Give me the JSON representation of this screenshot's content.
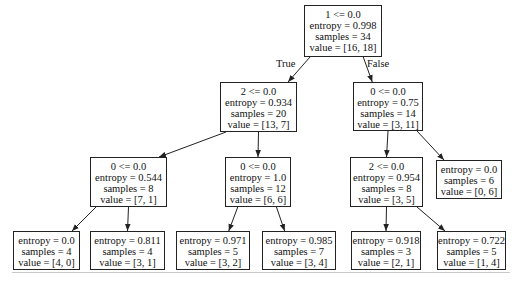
{
  "diagram": {
    "type": "decision-tree",
    "edge_labels": {
      "true": "True",
      "false": "False"
    },
    "nodes": [
      {
        "id": "n0",
        "lines": [
          "1 <= 0.0",
          "entropy = 0.998",
          "samples = 34",
          "value = [16, 18]"
        ],
        "box": [
          304,
          5,
          78,
          52
        ]
      },
      {
        "id": "n1",
        "lines": [
          "2 <= 0.0",
          "entropy = 0.934",
          "samples = 20",
          "value = [13, 7]"
        ],
        "box": [
          220,
          82,
          77,
          50
        ]
      },
      {
        "id": "n2",
        "lines": [
          "0 <= 0.0",
          "entropy = 0.75",
          "samples = 14",
          "value = [3, 11]"
        ],
        "box": [
          353,
          82,
          70,
          49
        ]
      },
      {
        "id": "n3",
        "lines": [
          "0 <= 0.0",
          "entropy = 0.544",
          "samples = 8",
          "value = [7, 1]"
        ],
        "box": [
          90,
          157,
          77,
          50
        ]
      },
      {
        "id": "n4",
        "lines": [
          "0 <= 0.0",
          "entropy = 1.0",
          "samples = 12",
          "value = [6, 6]"
        ],
        "box": [
          225,
          157,
          66,
          50
        ]
      },
      {
        "id": "n5",
        "lines": [
          "2 <= 0.0",
          "entropy = 0.954",
          "samples = 8",
          "value = [3, 5]"
        ],
        "box": [
          350,
          157,
          73,
          50
        ]
      },
      {
        "id": "n6",
        "lines": [
          "entropy = 0.0",
          "samples = 6",
          "value = [0, 6]"
        ],
        "box": [
          436,
          160,
          66,
          39
        ]
      },
      {
        "id": "n7",
        "lines": [
          "entropy = 0.0",
          "samples = 4",
          "value = [4, 0]"
        ],
        "box": [
          13,
          231,
          67,
          39
        ]
      },
      {
        "id": "n8",
        "lines": [
          "entropy = 0.811",
          "samples = 4",
          "value = [3, 1]"
        ],
        "box": [
          90,
          231,
          75,
          39
        ]
      },
      {
        "id": "n9",
        "lines": [
          "entropy = 0.971",
          "samples = 5",
          "value = [3, 2]"
        ],
        "box": [
          176,
          231,
          74,
          39
        ]
      },
      {
        "id": "n10",
        "lines": [
          "entropy = 0.985",
          "samples = 7",
          "value = [3, 4]"
        ],
        "box": [
          262,
          231,
          74,
          39
        ]
      },
      {
        "id": "n11",
        "lines": [
          "entropy = 0.918",
          "samples = 3",
          "value = [2, 1]"
        ],
        "box": [
          351,
          231,
          70,
          39
        ]
      },
      {
        "id": "n12",
        "lines": [
          "entropy = 0.722",
          "samples = 5",
          "value = [1, 4]"
        ],
        "box": [
          437,
          231,
          69,
          39
        ]
      }
    ],
    "edges": [
      {
        "from": "n0",
        "to": "n1",
        "label": "True"
      },
      {
        "from": "n0",
        "to": "n2",
        "label": "False"
      },
      {
        "from": "n1",
        "to": "n3"
      },
      {
        "from": "n1",
        "to": "n4"
      },
      {
        "from": "n2",
        "to": "n5"
      },
      {
        "from": "n2",
        "to": "n6"
      },
      {
        "from": "n3",
        "to": "n7"
      },
      {
        "from": "n3",
        "to": "n8"
      },
      {
        "from": "n4",
        "to": "n9"
      },
      {
        "from": "n4",
        "to": "n10"
      },
      {
        "from": "n5",
        "to": "n11"
      },
      {
        "from": "n5",
        "to": "n12"
      }
    ],
    "edge_label_positions": {
      "True": [
        276,
        58
      ],
      "False": [
        367,
        58
      ]
    }
  }
}
